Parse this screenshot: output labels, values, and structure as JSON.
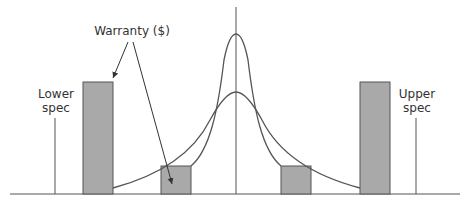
{
  "diagram": {
    "title": "",
    "labels": {
      "warranty": "Warranty ($)",
      "lower_spec_line1": "Lower",
      "lower_spec_line2": "spec",
      "upper_spec_line1": "Upper",
      "upper_spec_line2": "spec"
    },
    "colors": {
      "bar_fill": "#a9a9a9",
      "line": "#555555"
    },
    "elements": {
      "curves": [
        "narrow distribution",
        "wide distribution"
      ],
      "bars": [
        "tall left bar",
        "short left bar",
        "short right bar",
        "tall right bar"
      ],
      "spec_limits": [
        "lower spec",
        "upper spec"
      ]
    }
  }
}
